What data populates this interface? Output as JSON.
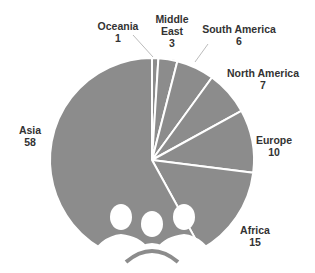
{
  "chart_data": {
    "type": "pie",
    "title": "",
    "categories": [
      "Oceania",
      "Middle East",
      "South America",
      "North America",
      "Europe",
      "Africa",
      "Asia"
    ],
    "values": [
      1,
      3,
      6,
      7,
      10,
      15,
      58
    ],
    "labels": [
      {
        "name": "Oceania",
        "value": "1"
      },
      {
        "name": "Middle\nEast",
        "value": "3"
      },
      {
        "name": "South America",
        "value": "6"
      },
      {
        "name": "North America",
        "value": "7"
      },
      {
        "name": "Europe",
        "value": "10"
      },
      {
        "name": "Africa",
        "value": "15"
      },
      {
        "name": "Asia",
        "value": "58"
      }
    ],
    "slice_color": "#8c8c8c",
    "separator_color": "#ffffff",
    "legend": "none",
    "decoration": "people-group-icon"
  }
}
